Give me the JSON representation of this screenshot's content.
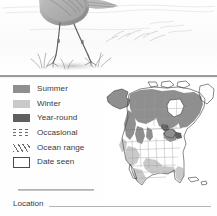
{
  "page": {
    "background": "#fefefe",
    "divider_color": "#9a9a9a"
  },
  "illustration": {
    "name": "bird-pencil-illustration",
    "subject": "wading bird legs standing in marsh grass",
    "medium": "pencil drawing",
    "alt": "Pencil sketch of a long-legged wading bird standing in shallow water with grass tufts"
  },
  "legend": {
    "title": "",
    "items": [
      {
        "label": "Summer",
        "swatch": "solid-swatch",
        "color": "#8f8f8f"
      },
      {
        "label": "Winter",
        "swatch": "solid-swatch",
        "color": "#c9c9c9"
      },
      {
        "label": "Year-round",
        "swatch": "solid-swatch",
        "color": "#5f5f5f"
      },
      {
        "label": "Occasional",
        "swatch": "dotted-bars-swatch",
        "color": "#6e6e6e"
      },
      {
        "label": "Ocean range",
        "swatch": "diagonal-hatch-swatch",
        "color": "#6b6b6b"
      },
      {
        "label": "Date seen",
        "swatch": "empty-box-swatch",
        "color": "#4a4a4a"
      }
    ]
  },
  "location": {
    "label": "Location",
    "value": "",
    "placeholder": ""
  },
  "map": {
    "name": "north-america-range-map",
    "region": "North America",
    "summer_color": "#8f8f8f",
    "winter_color": "#c9c9c9",
    "year_round_color": "#5f5f5f",
    "outline_color": "#4a4a4a",
    "regions_shaded_summer": [
      "Alaska",
      "Western Canada",
      "Central Canada",
      "Eastern Canada"
    ],
    "regions_shaded_winter": [
      "Southwest United States",
      "Gulf Coast",
      "Florida",
      "Pacific Coast"
    ]
  }
}
